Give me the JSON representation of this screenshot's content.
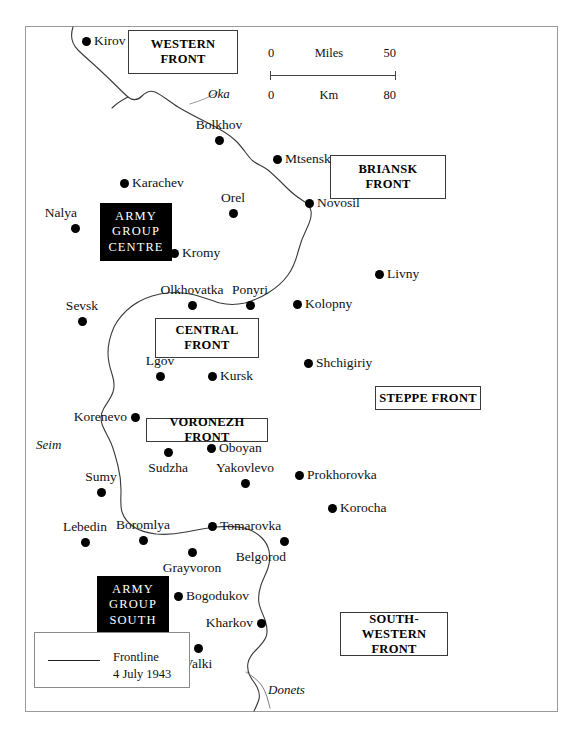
{
  "map": {
    "title": "Battle of Kursk area map",
    "frame": {
      "border_color": "#9a9a9a"
    },
    "scale": {
      "miles_zero": "0",
      "miles_label": "Miles",
      "miles_max": "50",
      "km_zero": "0",
      "km_label": "Km",
      "km_max": "80"
    },
    "legend": {
      "line_label": "Frontline",
      "date_label": "4 July 1943"
    },
    "fronts": [
      {
        "id": "western",
        "lines": [
          "WESTERN",
          "FRONT"
        ],
        "x": 128,
        "y": 30,
        "w": 110,
        "h": 44
      },
      {
        "id": "briansk",
        "lines": [
          "BRIANSK",
          "FRONT"
        ],
        "x": 330,
        "y": 155,
        "w": 116,
        "h": 44
      },
      {
        "id": "central",
        "lines": [
          "CENTRAL",
          "FRONT"
        ],
        "x": 155,
        "y": 318,
        "w": 104,
        "h": 40
      },
      {
        "id": "steppe",
        "lines": [
          "STEPPE FRONT"
        ],
        "x": 375,
        "y": 386,
        "w": 106,
        "h": 24
      },
      {
        "id": "voronezh",
        "lines": [
          "VORONEZH FRONT"
        ],
        "x": 146,
        "y": 418,
        "w": 122,
        "h": 24
      },
      {
        "id": "south-western",
        "lines": [
          "SOUTH-WESTERN",
          "FRONT"
        ],
        "x": 340,
        "y": 612,
        "w": 108,
        "h": 44
      }
    ],
    "army_groups": [
      {
        "id": "centre",
        "lines": [
          "ARMY",
          "GROUP",
          "CENTRE"
        ],
        "x": 100,
        "y": 203,
        "w": 72,
        "h": 58
      },
      {
        "id": "south",
        "lines": [
          "ARMY",
          "GROUP",
          "SOUTH"
        ],
        "x": 97,
        "y": 576,
        "w": 72,
        "h": 58
      }
    ],
    "rivers": [
      {
        "name": "Oka",
        "x": 208,
        "y": 86
      },
      {
        "name": "Seim",
        "x": 36,
        "y": 437
      },
      {
        "name": "Donets",
        "x": 268,
        "y": 682
      }
    ],
    "cities": [
      {
        "name": "Kirov",
        "x": 86,
        "y": 41,
        "placement": "lbl-right"
      },
      {
        "name": "Bolkhov",
        "x": 219,
        "y": 140,
        "placement": "lbl-above"
      },
      {
        "name": "Mtsensk",
        "x": 277,
        "y": 159,
        "placement": "lbl-right"
      },
      {
        "name": "Karachev",
        "x": 124,
        "y": 183,
        "placement": "lbl-right"
      },
      {
        "name": "Orel",
        "x": 233,
        "y": 213,
        "placement": "lbl-above"
      },
      {
        "name": "Novosil",
        "x": 309,
        "y": 203,
        "placement": "lbl-right"
      },
      {
        "name": "Nalya",
        "x": 75,
        "y": 228,
        "placement": "lbl-above-left"
      },
      {
        "name": "Kromy",
        "x": 174,
        "y": 253,
        "placement": "lbl-right"
      },
      {
        "name": "Livny",
        "x": 379,
        "y": 274,
        "placement": "lbl-right"
      },
      {
        "name": "Olkhovatka",
        "x": 192,
        "y": 305,
        "placement": "lbl-above"
      },
      {
        "name": "Ponyri",
        "x": 250,
        "y": 305,
        "placement": "lbl-above"
      },
      {
        "name": "Kolopny",
        "x": 297,
        "y": 304,
        "placement": "lbl-right"
      },
      {
        "name": "Sevsk",
        "x": 82,
        "y": 321,
        "placement": "lbl-above"
      },
      {
        "name": "Lgov",
        "x": 160,
        "y": 376,
        "placement": "lbl-above"
      },
      {
        "name": "Kursk",
        "x": 212,
        "y": 376,
        "placement": "lbl-right"
      },
      {
        "name": "Shchigiriy",
        "x": 308,
        "y": 363,
        "placement": "lbl-right"
      },
      {
        "name": "Korenevo",
        "x": 135,
        "y": 417,
        "placement": "lbl-left"
      },
      {
        "name": "Oboyan",
        "x": 211,
        "y": 448,
        "placement": "lbl-right"
      },
      {
        "name": "Sudzha",
        "x": 168,
        "y": 452,
        "placement": "lbl-below"
      },
      {
        "name": "Yakovlevo",
        "x": 245,
        "y": 483,
        "placement": "lbl-above"
      },
      {
        "name": "Prokhorovka",
        "x": 299,
        "y": 475,
        "placement": "lbl-right"
      },
      {
        "name": "Sumy",
        "x": 101,
        "y": 492,
        "placement": "lbl-above"
      },
      {
        "name": "Korocha",
        "x": 332,
        "y": 508,
        "placement": "lbl-right"
      },
      {
        "name": "Lebedin",
        "x": 85,
        "y": 542,
        "placement": "lbl-above"
      },
      {
        "name": "Boromlya",
        "x": 143,
        "y": 540,
        "placement": "lbl-above"
      },
      {
        "name": "Tomarovka",
        "x": 212,
        "y": 526,
        "placement": "lbl-right"
      },
      {
        "name": "Belgorod",
        "x": 284,
        "y": 541,
        "placement": "lbl-below-left"
      },
      {
        "name": "Grayvoron",
        "x": 192,
        "y": 552,
        "placement": "lbl-below"
      },
      {
        "name": "Bogodukov",
        "x": 178,
        "y": 596,
        "placement": "lbl-right"
      },
      {
        "name": "Kharkov",
        "x": 261,
        "y": 623,
        "placement": "lbl-left"
      },
      {
        "name": "Valki",
        "x": 198,
        "y": 648,
        "placement": "lbl-below"
      }
    ],
    "frontline": {
      "label": "Frontline 4 July 1943",
      "color": "#3a3a3a",
      "path": "M 73,27 C 70,36 72,44 78,50 C 86,58 96,66 104,74 C 114,83 122,92 128,97 C 133,101 138,100 142,96 C 146,92 150,90 155,92 C 162,95 170,102 178,107 C 188,113 198,118 208,123 C 218,128 228,133 236,141 C 244,149 248,157 253,161 C 258,165 263,166 268,170 C 274,175 280,181 286,187 C 292,193 297,197 302,200 C 307,203 310,206 311,211 C 312,217 310,222 307,228 C 303,236 300,244 298,252 C 296,260 293,268 288,275 C 283,282 276,288 268,293 C 260,298 252,301 245,303 C 236,305 228,305 220,303 C 210,300 200,296 190,294 C 180,292 170,292 160,294 C 150,296 140,300 132,306 C 124,312 118,319 114,327 C 110,336 108,345 108,353 C 108,361 110,368 112,374 C 114,380 115,386 113,392 C 111,398 107,403 104,408 C 101,413 100,418 102,424 C 104,430 108,436 111,443 C 114,450 116,458 118,466 C 120,474 121,482 121,490 C 121,498 120,506 122,512 C 124,518 128,523 134,527 C 140,531 148,533 156,534 C 166,535 176,534 186,532 C 196,530 206,528 216,527 C 226,526 236,526 244,528 C 252,530 258,534 262,538 C 266,542 268,546 269,551 C 270,556 270,562 268,568 C 266,574 263,579 261,585 C 259,591 258,597 259,603 C 260,609 263,614 265,620 C 267,626 268,632 266,637 C 264,642 260,646 256,650 C 252,654 249,658 248,663 C 247,668 248,672 250,676 C 252,680 255,683 257,687 C 259,691 260,695 259,699 C 258,703 256,707 254,711",
      "branch_left": "M 128,97 C 122,100 116,104 112,108"
    },
    "river_paths": {
      "oka": "M 190,104 C 200,101 210,97 218,92",
      "donets": "M 246,672 C 252,676 258,680 262,686 C 266,692 268,700 270,708"
    }
  }
}
